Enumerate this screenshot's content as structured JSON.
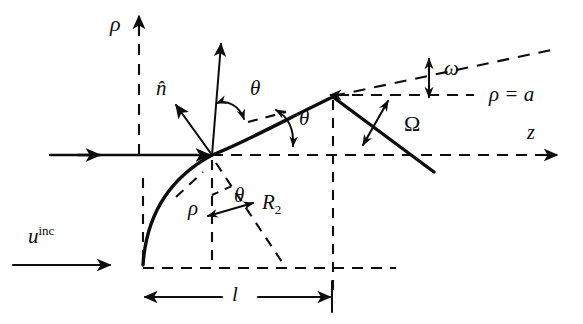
{
  "figure": {
    "domain": "scientific-geometry-diagram",
    "background_color": "#ffffff",
    "ink_color": "#0d0d0d",
    "width": 583,
    "height": 324
  },
  "axes": {
    "rho_axis_label": "ρ",
    "z_axis_label": "z"
  },
  "labels": {
    "normal_vector": "n̂",
    "theta_1": "θ",
    "theta_2": "θ",
    "theta_3": "θ",
    "omega": "ω",
    "big_omega": "Ω",
    "rho_radial": "ρ",
    "radius_base": "R",
    "radius_subscript": "2",
    "length_l": "l",
    "incident_base": "u",
    "incident_superscript": "inc",
    "rho_equals_a": "ρ = a"
  },
  "geometry": {
    "z_axis_y": 155,
    "rho_axis_x": 139,
    "surface_point": [
      212,
      155
    ],
    "apex": [
      333,
      97
    ],
    "curve_start": [
      143,
      265
    ],
    "line_end": [
      434,
      172
    ],
    "rho_equals_a_y": 95,
    "dimension_line_y": 297
  }
}
